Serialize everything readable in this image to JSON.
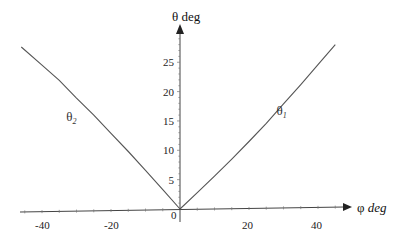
{
  "chart_data": {
    "type": "line",
    "title": "",
    "xlabel": "φ",
    "xlabel_unit": "deg",
    "ylabel": "θ deg",
    "xlim": [
      -50,
      50
    ],
    "ylim": [
      0,
      30
    ],
    "x_ticks": [
      -40,
      -20,
      0,
      20,
      40
    ],
    "x_tick_labels": [
      "-40",
      "-20",
      "0",
      "20",
      "40"
    ],
    "y_ticks": [
      5,
      10,
      15,
      20,
      25
    ],
    "y_tick_labels": [
      "5",
      "10",
      "15",
      "20",
      "25"
    ],
    "grid": false,
    "legend": "none (inline curve labels)",
    "series": [
      {
        "name": "θ1",
        "label_main": "θ",
        "label_sub": "1",
        "label_at": {
          "x": 28,
          "y": 16
        },
        "x": [
          0,
          5,
          10,
          15,
          20,
          25,
          30,
          35,
          40,
          45
        ],
        "y": [
          0,
          2.8,
          5.6,
          8.5,
          11.5,
          14.6,
          17.9,
          21.2,
          24.6,
          28.0
        ]
      },
      {
        "name": "θ2",
        "label_main": "θ",
        "label_sub": "2",
        "label_at": {
          "x": -33,
          "y": 15
        },
        "x": [
          -46,
          -40,
          -35,
          -30,
          -25,
          -20,
          -15,
          -10,
          -5,
          0
        ],
        "y": [
          27.6,
          24.5,
          21.9,
          18.9,
          16.0,
          12.9,
          9.8,
          6.6,
          3.3,
          0
        ]
      }
    ]
  }
}
